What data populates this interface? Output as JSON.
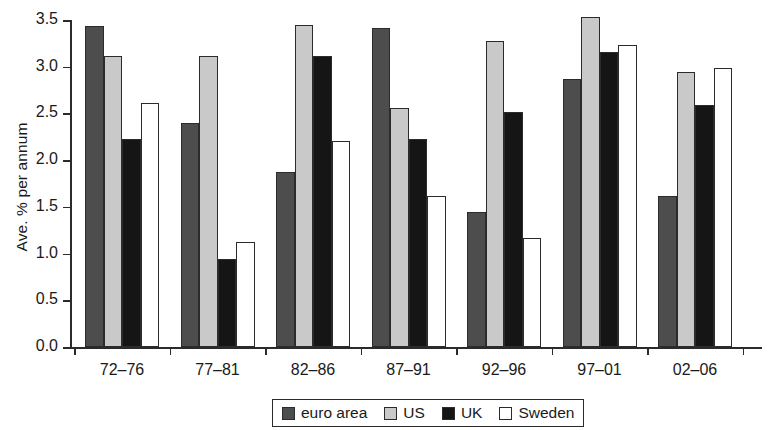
{
  "chart_data": {
    "type": "bar",
    "title": "",
    "subtitle": "",
    "xlabel": "",
    "ylabel": "Ave. % per annum",
    "ylim": [
      0.0,
      3.5
    ],
    "yticks": [
      "0.0",
      "0.5",
      "1.0",
      "1.5",
      "2.0",
      "2.5",
      "3.0",
      "3.5"
    ],
    "ytick_values": [
      0.0,
      0.5,
      1.0,
      1.5,
      2.0,
      2.5,
      3.0,
      3.5
    ],
    "grid": false,
    "legend_position": "bottom-center",
    "categories": [
      "72–76",
      "77–81",
      "82–86",
      "87–91",
      "92–96",
      "97–01",
      "02–06"
    ],
    "series": [
      {
        "name": "euro area",
        "color": "#4d4d4d",
        "values": [
          3.44,
          2.4,
          1.87,
          3.41,
          1.44,
          2.87,
          1.62
        ]
      },
      {
        "name": "US",
        "color": "#c9c9c9",
        "values": [
          3.11,
          3.12,
          3.45,
          2.56,
          3.28,
          3.53,
          2.94
        ]
      },
      {
        "name": "UK",
        "color": "#151515",
        "values": [
          2.23,
          0.94,
          3.12,
          2.23,
          2.52,
          3.16,
          2.59
        ]
      },
      {
        "name": "Sweden",
        "color": "#ffffff",
        "values": [
          2.61,
          1.12,
          2.21,
          1.62,
          1.17,
          3.23,
          2.99
        ]
      }
    ]
  }
}
